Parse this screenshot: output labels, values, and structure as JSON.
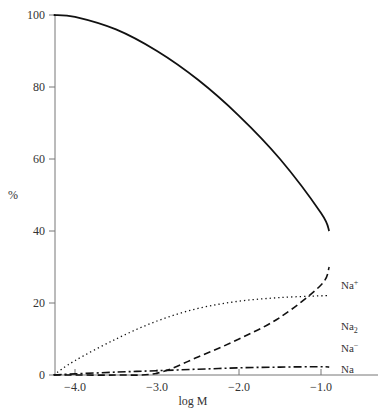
{
  "chart_data": {
    "type": "line",
    "title": "",
    "xlabel": "log M",
    "ylabel": "%",
    "xlim": [
      -4.26,
      -0.6
    ],
    "ylim": [
      0,
      100
    ],
    "grid": false,
    "legend_position": "inline labels at right end of each curve",
    "x_ticks": [
      -4.0,
      -3.0,
      -2.0,
      -1.0
    ],
    "x_tick_labels": [
      "−4.0",
      "−3.0",
      "−2.0",
      "−1.0"
    ],
    "y_ticks": [
      0,
      20,
      40,
      60,
      80,
      100
    ],
    "y_tick_labels": [
      "0",
      "20",
      "40",
      "60",
      "80",
      "100"
    ],
    "x": [
      -4.26,
      -4.0,
      -3.5,
      -3.0,
      -2.5,
      -2.0,
      -1.5,
      -1.0,
      -0.9
    ],
    "series": [
      {
        "name": "Na+",
        "label": "Na",
        "label_sup": "+",
        "style": "solid",
        "values": [
          100,
          99.5,
          96,
          90,
          82,
          72,
          60,
          45,
          40
        ]
      },
      {
        "name": "Na2",
        "label": "Na",
        "label_sub": "2",
        "style": "dashed",
        "values": [
          0,
          0,
          0,
          0.5,
          5,
          10,
          16,
          25,
          30
        ]
      },
      {
        "name": "Na-",
        "label": "Na",
        "label_sup": "−",
        "style": "dotted",
        "values": [
          0,
          4,
          10,
          15,
          18.5,
          20.5,
          21.5,
          22,
          22
        ]
      },
      {
        "name": "Na",
        "label": "Na",
        "style": "dash-dot",
        "values": [
          0,
          0.3,
          0.8,
          1.2,
          1.6,
          2,
          2.2,
          2.3,
          2.2
        ]
      }
    ]
  },
  "axes": {
    "xlabel": "log M",
    "ylabel": "%"
  },
  "labels": {
    "na_plus": {
      "base": "Na",
      "sup": "+"
    },
    "na_2": {
      "base": "Na",
      "sub": "2"
    },
    "na_minus": {
      "base": "Na",
      "sup": "−"
    },
    "na": {
      "base": "Na"
    }
  }
}
